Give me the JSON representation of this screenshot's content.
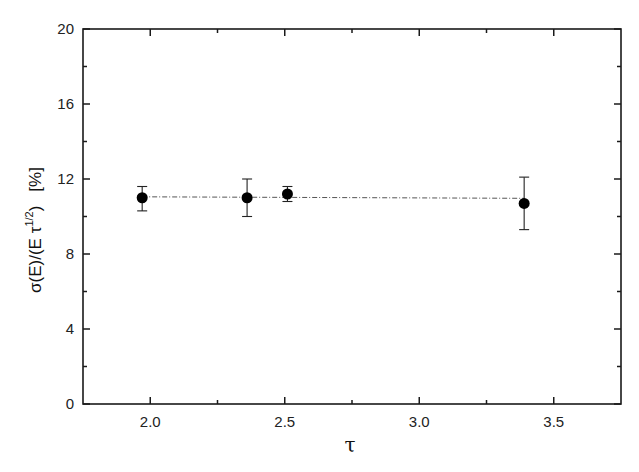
{
  "chart_data": {
    "type": "scatter",
    "title": "",
    "xlabel": "τ",
    "ylabel": "σ(E)/(E τ^1/2)   [%]",
    "ylabel_parts": {
      "main": "σ(E)/(E τ",
      "sup": "1/2",
      "close": ")",
      "unit": "[%]"
    },
    "xlim": [
      1.75,
      3.75
    ],
    "ylim": [
      0,
      20
    ],
    "xticks": [
      2.0,
      2.5,
      3.0,
      3.5
    ],
    "xtick_labels": [
      "2.0",
      "2.5",
      "3.0",
      "3.5"
    ],
    "xminor": [
      2.25,
      2.75,
      3.25
    ],
    "yticks": [
      0,
      4,
      8,
      12,
      16,
      20
    ],
    "ytick_labels": [
      "0",
      "4",
      "8",
      "12",
      "16",
      "20"
    ],
    "yminor": [
      2,
      6,
      10,
      14,
      18
    ],
    "grid": false,
    "legend": null,
    "series": [
      {
        "name": "data",
        "marker": "filled-circle",
        "color": "#000000",
        "points": [
          {
            "x": 1.97,
            "y": 11.0,
            "yerr_low": 10.3,
            "yerr_high": 11.6
          },
          {
            "x": 2.36,
            "y": 11.0,
            "yerr_low": 10.0,
            "yerr_high": 12.0
          },
          {
            "x": 2.51,
            "y": 11.2,
            "yerr_low": 10.8,
            "yerr_high": 11.6
          },
          {
            "x": 3.39,
            "y": 10.7,
            "yerr_low": 9.3,
            "yerr_high": 12.1
          }
        ]
      },
      {
        "name": "fit",
        "type": "line",
        "style": "dash-dot",
        "color": "#555555",
        "x": [
          1.97,
          3.39
        ],
        "y": [
          11.05,
          10.97
        ]
      }
    ]
  }
}
